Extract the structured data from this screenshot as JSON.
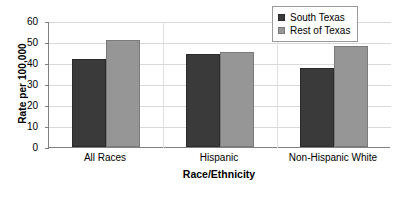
{
  "chart_data": {
    "type": "bar",
    "title": "",
    "xlabel": "Race/Ethnicity",
    "ylabel": "Rate per 100,000",
    "categories": [
      "All Races",
      "Hispanic",
      "Non-Hispanic White"
    ],
    "series": [
      {
        "name": "South Texas",
        "color": "#3a3a3a",
        "values": [
          42.0,
          44.5,
          37.5
        ]
      },
      {
        "name": "Rest of Texas",
        "color": "#969696",
        "values": [
          51.0,
          45.3,
          48.0
        ]
      }
    ],
    "ylim": [
      0,
      60
    ],
    "ytick_labels": [
      "0",
      "10",
      "20",
      "30",
      "40",
      "50",
      "60"
    ],
    "ytick_values": [
      0,
      10,
      20,
      30,
      40,
      50,
      60
    ],
    "grid": "horizontal",
    "legend_position": "top-right"
  }
}
